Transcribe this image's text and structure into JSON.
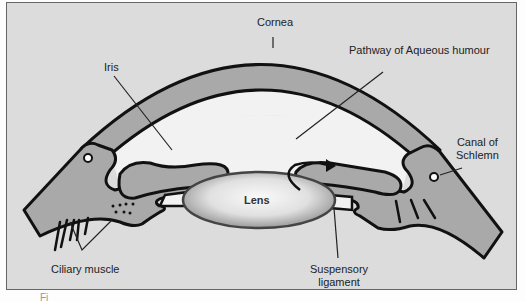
{
  "diagram": {
    "labels": {
      "cornea": "Cornea",
      "iris": "Iris",
      "pathway": "Pathway of Aqueous humour",
      "canal_line1": "Canal of",
      "canal_line2": "Schlemn",
      "lens": "Lens",
      "ciliary": "Ciliary muscle",
      "suspensory_line1": "Suspensory",
      "suspensory_line2": "ligament"
    },
    "caption_fragment": "Fi",
    "colors": {
      "background": "#dcdcdc",
      "tissue": "#a9a9a9",
      "outline": "#111111",
      "chamber": "#f2f2f2"
    }
  }
}
